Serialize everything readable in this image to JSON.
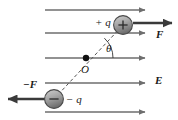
{
  "figure": {
    "background_color": "#ffffff",
    "width": 178,
    "height": 120,
    "line_color": "#6e6e6e",
    "dark_line_color": "#3a3a3a",
    "text_color": "#1a1a1a",
    "dipole_axis_style": "dashed"
  },
  "labels": {
    "positive_charge": "+ q",
    "negative_charge": "− q",
    "force_positive": "F",
    "force_negative": "−F",
    "field": "E",
    "angle": "θ",
    "origin": "O"
  },
  "charges": [
    {
      "name": "positive-charge",
      "sign": "+",
      "label": "+ q",
      "cx": 123,
      "cy": 25,
      "r": 9.5,
      "fill_top": "#b6b6b6",
      "fill_bottom": "#7d7d7d"
    },
    {
      "name": "negative-charge",
      "sign": "−",
      "label": "− q",
      "cx": 54,
      "cy": 99,
      "r": 9.5,
      "fill_top": "#b6b6b6",
      "fill_bottom": "#7d7d7d"
    }
  ],
  "field_lines": [
    {
      "name": "field-line-1",
      "y": 10,
      "x1": 45,
      "x2": 147
    },
    {
      "name": "field-line-2",
      "y": 33,
      "x1": 45,
      "x2": 147
    },
    {
      "name": "field-line-3",
      "y": 58,
      "x1": 45,
      "x2": 147
    },
    {
      "name": "field-line-4",
      "y": 83,
      "x1": 45,
      "x2": 147
    },
    {
      "name": "field-line-5",
      "y": 112,
      "x1": 45,
      "x2": 147
    }
  ],
  "force_vectors": [
    {
      "name": "force-on-positive-charge",
      "label": "F",
      "x1": 133,
      "y1": 23,
      "x2": 173,
      "y2": 23,
      "direction": "right"
    },
    {
      "name": "force-on-negative-charge",
      "label": "−F",
      "x1": 45,
      "y1": 99,
      "x2": 6,
      "y2": 99,
      "direction": "left"
    }
  ],
  "dipole_axis": {
    "name": "dipole-axis",
    "from_x": 54,
    "from_y": 99,
    "to_x": 123,
    "to_y": 25
  },
  "origin_point": {
    "name": "origin-point",
    "cx": 86,
    "cy": 58,
    "r": 3.2
  },
  "angle_arc": {
    "name": "angle-arc",
    "center_x": 86,
    "center_y": 58,
    "radius": 27,
    "start_deg": 0,
    "end_deg": -47
  },
  "label_positions": {
    "positive_charge": {
      "left": 95,
      "top": 17
    },
    "negative_charge": {
      "left": 66,
      "top": 94
    },
    "force_positive": {
      "left": 155,
      "top": 29
    },
    "force_negative": {
      "left": 23,
      "top": 79
    },
    "field": {
      "left": 155,
      "top": 75
    },
    "angle": {
      "left": 106,
      "top": 43
    },
    "origin": {
      "left": 81,
      "top": 64
    }
  }
}
